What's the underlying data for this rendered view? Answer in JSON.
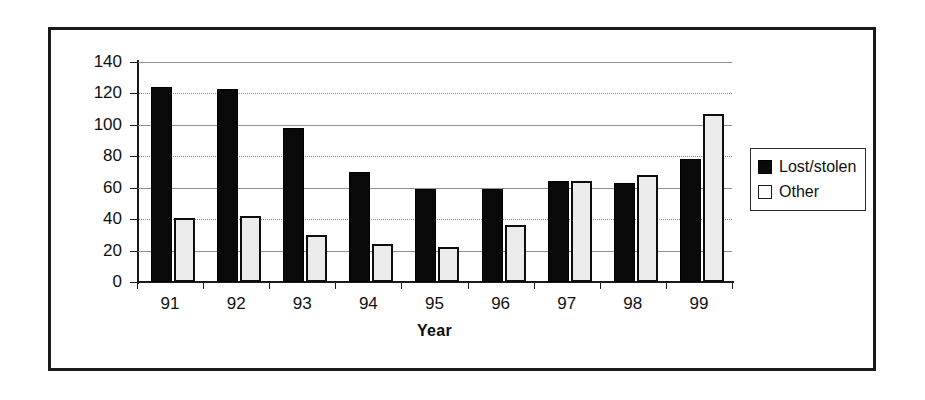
{
  "chart_data": {
    "type": "bar",
    "title": "",
    "xlabel": "Year",
    "ylabel": "",
    "categories": [
      "91",
      "92",
      "93",
      "94",
      "95",
      "96",
      "97",
      "98",
      "99"
    ],
    "series": [
      {
        "name": "Lost/stolen",
        "values": [
          124,
          123,
          98,
          70,
          59,
          59,
          64,
          63,
          78
        ],
        "color": "#090909"
      },
      {
        "name": "Other",
        "values": [
          41,
          42,
          30,
          24,
          22,
          36,
          64,
          68,
          107
        ],
        "color": "#ebebeb"
      }
    ],
    "ylim": [
      0,
      140
    ],
    "ytick_labels": [
      "140",
      "120",
      "100",
      "80",
      "60",
      "40",
      "20",
      "0"
    ],
    "ytick_values": [
      140,
      120,
      100,
      80,
      60,
      40,
      20,
      0
    ],
    "grid": true,
    "grid_axis": "y",
    "legend_position": "right"
  },
  "legend": {
    "items": [
      {
        "label": "Lost/stolen",
        "swatch": "filled-black-square"
      },
      {
        "label": "Other",
        "swatch": "outlined-white-square"
      }
    ]
  }
}
